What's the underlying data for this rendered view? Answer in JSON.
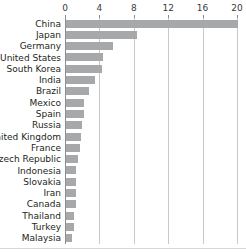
{
  "chart_data": {
    "type": "bar",
    "orientation": "horizontal",
    "title": "",
    "subtitle": "",
    "xlabel": "",
    "ylabel": "",
    "xlim": [
      0,
      20
    ],
    "xticks": [
      0,
      4,
      8,
      12,
      16,
      20
    ],
    "xtick_labels": [
      "0",
      "4",
      "8",
      "12",
      "16",
      "20"
    ],
    "grid": "vertical",
    "legend": "none",
    "bar_color": "#a6a8aa",
    "gridline_color": "#c9c9c9",
    "axis_color": "#8d8d8d",
    "text_color": "#231f20",
    "background": "#ffffff",
    "categories": [
      "China",
      "Japan",
      "Germany",
      "United States",
      "South Korea",
      "India",
      "Brazil",
      "Mexico",
      "Spain",
      "Russia",
      "United Kingdom",
      "France",
      "Czech Republic",
      "Indonesia",
      "Slovakia",
      "Iran",
      "Canada",
      "Thailand",
      "Turkey",
      "Malaysia"
    ],
    "values": [
      20.0,
      8.2,
      5.5,
      4.3,
      4.2,
      3.4,
      2.7,
      2.1,
      2.1,
      1.9,
      1.7,
      1.65,
      1.35,
      1.2,
      1.2,
      1.2,
      1.15,
      0.95,
      0.9,
      0.75
    ]
  }
}
